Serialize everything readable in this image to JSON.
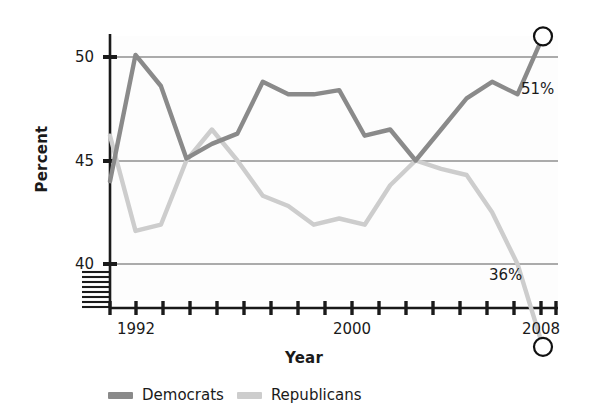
{
  "chart_data": {
    "type": "line",
    "title": "",
    "xlabel": "Year",
    "ylabel": "Percent",
    "x": [
      1991,
      1992,
      1993,
      1994,
      1995,
      1996,
      1997,
      1998,
      1999,
      2000,
      2001,
      2002,
      2003,
      2004,
      2005,
      2006,
      2007,
      2008
    ],
    "xlim": [
      1990.5,
      2008.6
    ],
    "ylim": [
      40,
      51.6
    ],
    "yticks": [
      40,
      45,
      50
    ],
    "ytick_labels": [
      "40",
      "45",
      "50"
    ],
    "xtick_labels_shown": [
      "1992",
      "2000",
      "2008"
    ],
    "xticks_all": [
      1991,
      1992,
      1993,
      1994,
      1995,
      1996,
      1997,
      1998,
      1999,
      2000,
      2001,
      2002,
      2003,
      2004,
      2005,
      2006,
      2007,
      2008
    ],
    "grid": "horizontal",
    "axis_break": true,
    "legend_position": "bottom",
    "series": [
      {
        "name": "Democrats",
        "color": "#8a8a8a",
        "values": [
          44.0,
          50.1,
          48.6,
          45.1,
          45.8,
          46.3,
          48.8,
          48.2,
          48.2,
          48.4,
          46.2,
          46.5,
          45.0,
          46.5,
          48.0,
          48.8,
          48.2,
          51.0
        ],
        "endpoint_label": "51%",
        "endpoint_marker": "open-circle"
      },
      {
        "name": "Republicans",
        "color": "#cdcdcd",
        "values": [
          46.2,
          41.6,
          41.9,
          45.0,
          46.5,
          45.0,
          43.3,
          42.8,
          41.9,
          42.2,
          41.9,
          43.8,
          45.0,
          44.6,
          44.3,
          42.5,
          40.0,
          36.0
        ],
        "endpoint_label": "36%",
        "endpoint_marker": "open-circle"
      }
    ]
  },
  "axes": {
    "y_title": "Percent",
    "x_title": "Year",
    "y_tick_labels": [
      "50",
      "45",
      "40"
    ],
    "x_tick_labels": [
      "1992",
      "2000",
      "2008"
    ]
  },
  "annotations": {
    "democrat_endpoint": "51%",
    "republican_endpoint": "36%"
  },
  "legend": {
    "items": [
      {
        "label": "Democrats",
        "color": "#8a8a8a"
      },
      {
        "label": "Republicans",
        "color": "#cdcdcd"
      }
    ]
  },
  "colors": {
    "democrat": "#8a8a8a",
    "republican": "#cdcdcd",
    "axis": "#1a1a1a",
    "grid": "#5a5a5a",
    "text": "#1a1a1a",
    "background": "#ffffff"
  }
}
